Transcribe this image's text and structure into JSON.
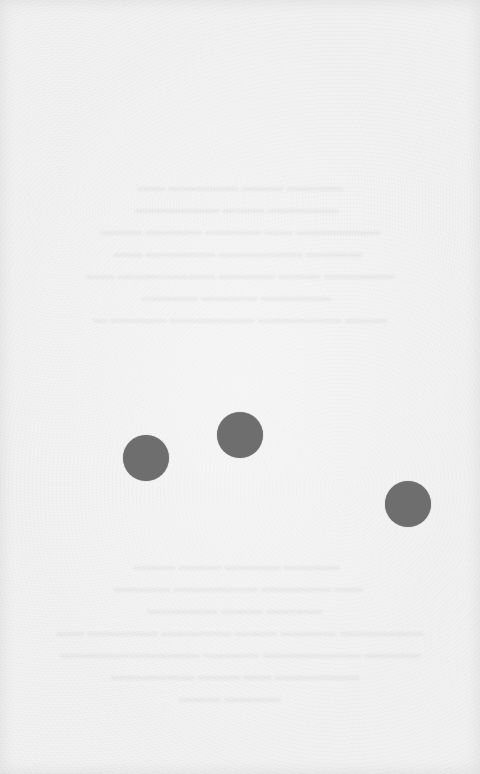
{
  "page": {
    "type": "scanned-blank-page",
    "background_color": "#f1f1f1",
    "bleed_through_text_legible": false
  },
  "dots": [
    {
      "id": 1,
      "cx": 146,
      "cy": 458,
      "r": 23,
      "color": "#6e6e6e"
    },
    {
      "id": 2,
      "cx": 240,
      "cy": 435,
      "r": 23,
      "color": "#6e6e6e"
    },
    {
      "id": 3,
      "cx": 408,
      "cy": 504,
      "r": 23,
      "color": "#6e6e6e"
    }
  ]
}
